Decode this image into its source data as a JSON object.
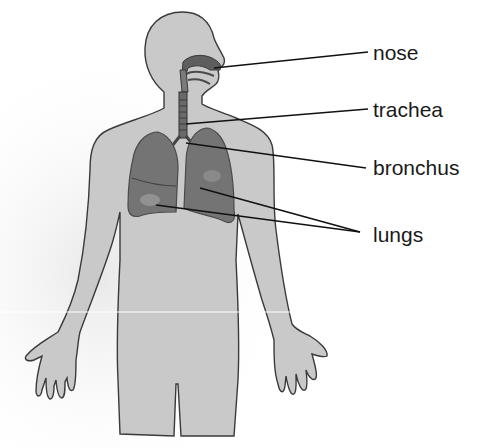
{
  "diagram": {
    "labels": [
      {
        "id": "nose",
        "text": "nose",
        "x": 373,
        "y": 42
      },
      {
        "id": "trachea",
        "text": "trachea",
        "x": 373,
        "y": 99
      },
      {
        "id": "bronchus",
        "text": "bronchus",
        "x": 373,
        "y": 157
      },
      {
        "id": "lungs",
        "text": "lungs",
        "x": 373,
        "y": 224
      }
    ],
    "colors": {
      "body_fill": "#c9c9c9",
      "body_outline": "#3a3a3a",
      "organ_fill": "#6f6f6f",
      "organ_dark": "#4a4a4a",
      "leader_line": "#111111",
      "background": "#ffffff"
    }
  }
}
